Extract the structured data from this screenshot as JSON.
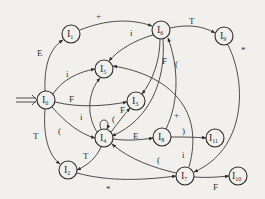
{
  "diagram": {
    "type": "state-transition-automaton",
    "start_state": "I0",
    "colors": {
      "background": "#f1f0ed",
      "stroke": "#333333",
      "node_fill": "#f1f0ed"
    },
    "nodes": [
      {
        "id": "I0",
        "letter": "I",
        "sub": "0",
        "x": 46,
        "y": 100
      },
      {
        "id": "I1",
        "letter": "I",
        "sub": "1",
        "x": 71,
        "y": 34
      },
      {
        "id": "I2",
        "letter": "I",
        "sub": "2",
        "x": 68,
        "y": 170
      },
      {
        "id": "I3",
        "letter": "I",
        "sub": "3",
        "x": 136,
        "y": 101
      },
      {
        "id": "I4",
        "letter": "I",
        "sub": "4",
        "x": 104,
        "y": 138
      },
      {
        "id": "I5",
        "letter": "I",
        "sub": "5",
        "x": 104,
        "y": 69
      },
      {
        "id": "I6",
        "letter": "I",
        "sub": "6",
        "x": 161,
        "y": 30
      },
      {
        "id": "I7",
        "letter": "I",
        "sub": "7",
        "x": 185,
        "y": 176
      },
      {
        "id": "I8",
        "letter": "I",
        "sub": "8",
        "x": 162,
        "y": 137
      },
      {
        "id": "I9",
        "letter": "I",
        "sub": "9",
        "x": 224,
        "y": 36
      },
      {
        "id": "I10",
        "letter": "I",
        "sub": "10",
        "x": 238,
        "y": 176
      },
      {
        "id": "I11",
        "letter": "I",
        "sub": "11",
        "x": 215,
        "y": 138
      }
    ],
    "edges": [
      {
        "from": "I0",
        "to": "I1",
        "label": "E"
      },
      {
        "from": "I0",
        "to": "I5",
        "label": "i"
      },
      {
        "from": "I0",
        "to": "I3",
        "label": "F"
      },
      {
        "from": "I0",
        "to": "I4",
        "label": "("
      },
      {
        "from": "I0",
        "to": "I2",
        "label": "T"
      },
      {
        "from": "I1",
        "to": "I6",
        "label": "+"
      },
      {
        "from": "I6",
        "to": "I9",
        "label": "T"
      },
      {
        "from": "I6",
        "to": "I5",
        "label": "i"
      },
      {
        "from": "I6",
        "to": "I3",
        "label": "F"
      },
      {
        "from": "I6",
        "to": "I4",
        "label": "("
      },
      {
        "from": "I9",
        "to": "I7",
        "label": "*"
      },
      {
        "from": "I4",
        "to": "I5",
        "label": "i"
      },
      {
        "from": "I4",
        "to": "I3",
        "label": "F"
      },
      {
        "from": "I4",
        "to": "I4",
        "label": "("
      },
      {
        "from": "I4",
        "to": "I8",
        "label": "E"
      },
      {
        "from": "I4",
        "to": "I2",
        "label": "T"
      },
      {
        "from": "I8",
        "to": "I6",
        "label": "+"
      },
      {
        "from": "I8",
        "to": "I11",
        "label": ")"
      },
      {
        "from": "I2",
        "to": "I7",
        "label": "*"
      },
      {
        "from": "I7",
        "to": "I4",
        "label": "("
      },
      {
        "from": "I7",
        "to": "I5",
        "label": "i"
      },
      {
        "from": "I7",
        "to": "I10",
        "label": "F"
      }
    ]
  }
}
